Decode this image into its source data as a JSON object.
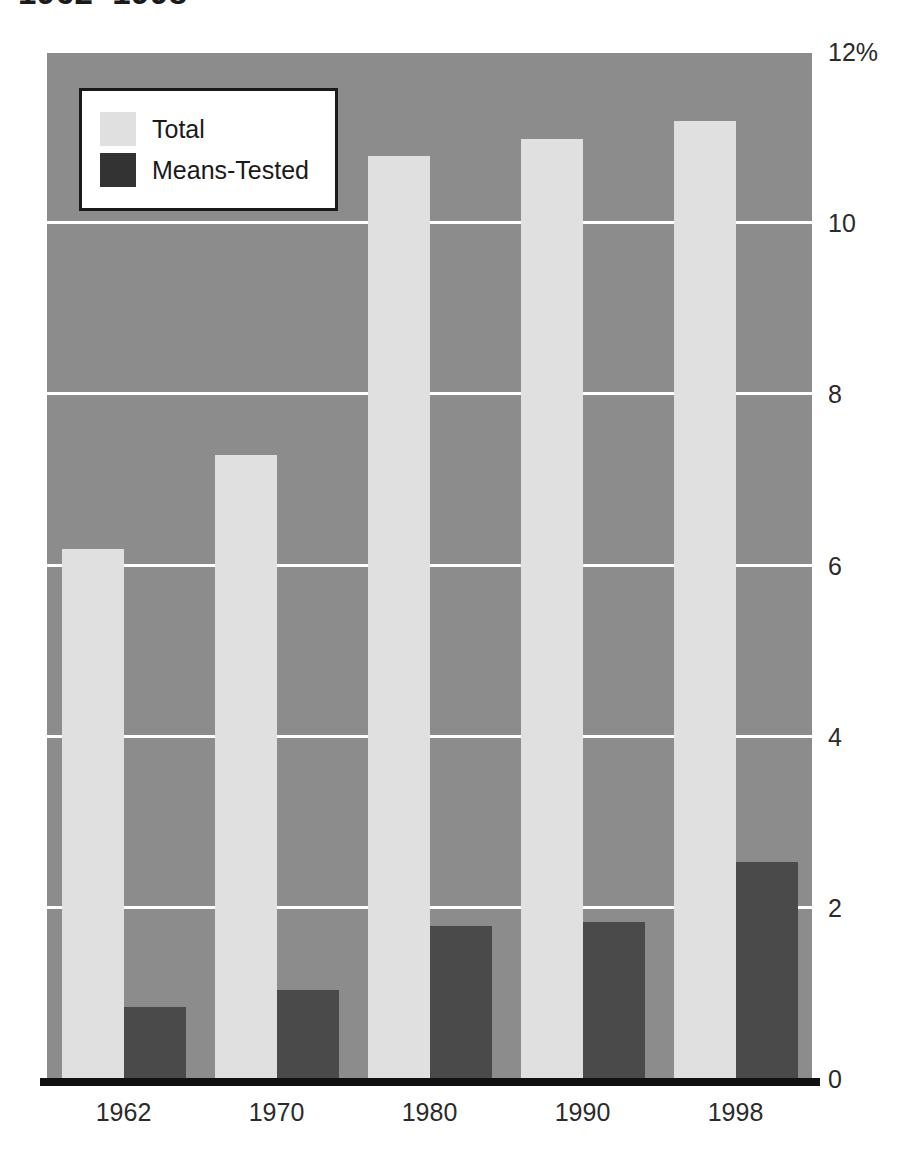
{
  "chart_data": {
    "type": "bar",
    "title": "1962–1998",
    "subtitle": "",
    "xlabel": "",
    "ylabel": "",
    "categories": [
      "1962",
      "1970",
      "1980",
      "1990",
      "1998"
    ],
    "series": [
      {
        "name": "Total",
        "color": "#e0e0e0",
        "values": [
          6.2,
          7.3,
          10.8,
          11.0,
          11.2
        ]
      },
      {
        "name": "Means-Tested",
        "color": "#4a4a4a",
        "values": [
          0.85,
          1.05,
          1.8,
          1.85,
          2.55
        ]
      }
    ],
    "ylim": [
      0,
      12
    ],
    "yticks": [
      0,
      2,
      4,
      6,
      8,
      10,
      12
    ],
    "ytick_labels": [
      "0",
      "2",
      "4",
      "6",
      "8",
      "10",
      "12%"
    ],
    "grid": true,
    "gridlines_at": [
      2,
      4,
      6,
      8,
      10
    ],
    "legend_position": "top-left",
    "plot_background": "#8c8c8c",
    "gridline_color": "#ffffff",
    "axis_color": "#111111"
  },
  "legend": {
    "entries": [
      {
        "label": "Total",
        "swatch": "total"
      },
      {
        "label": "Means-Tested",
        "swatch": "means"
      }
    ]
  }
}
